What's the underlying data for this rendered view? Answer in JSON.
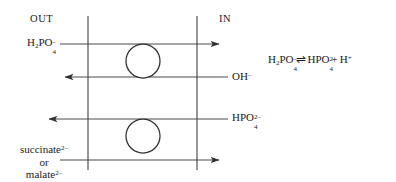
{
  "diagram": {
    "compartments": {
      "outside_label": "OUT",
      "inside_label": "IN"
    },
    "colors": {
      "line": "#3a3a3a",
      "text": "#1a1a1a",
      "background": "#ffffff"
    },
    "membranes": [
      {
        "name": "outer-membrane-line",
        "x": 88,
        "y1": 16,
        "y2": 170
      },
      {
        "name": "inner-membrane-line",
        "x": 197,
        "y1": 16,
        "y2": 170
      }
    ],
    "transporters": [
      {
        "name": "phosphate-transporter",
        "cx": 143,
        "cy": 61,
        "r": 17
      },
      {
        "name": "dicarboxylate-transporter",
        "cx": 143,
        "cy": 136,
        "r": 17
      }
    ],
    "transport_arrows": [
      {
        "name": "h2po4-influx-arrow",
        "y": 44,
        "x1": 60,
        "x2": 222,
        "direction": "right"
      },
      {
        "name": "oh-efflux-arrow",
        "y": 77,
        "x1": 62,
        "x2": 228,
        "direction": "left"
      },
      {
        "name": "hpo4-efflux-arrow",
        "y": 119,
        "x1": 46,
        "x2": 228,
        "direction": "left"
      },
      {
        "name": "dicarboxylate-influx-arrow",
        "y": 160,
        "x1": 60,
        "x2": 222,
        "direction": "right"
      }
    ],
    "labels": {
      "h2po4_out": {
        "formula": "H",
        "sub1": "2",
        "mid": "PO",
        "sub2": "4",
        "charge": "–"
      },
      "oh_in": {
        "formula": "OH",
        "charge": "–"
      },
      "hpo4_in": {
        "formula": "HPO",
        "sub": "4",
        "charge": "2–"
      },
      "succinate": {
        "name": "succinate",
        "charge": "2–"
      },
      "or_text": "or",
      "malate": {
        "name": "malate",
        "charge": "2–"
      }
    },
    "equation": {
      "name": "phosphate-dissociation-equilibrium",
      "reactant": {
        "formula": "H",
        "sub1": "2",
        "mid": "PO",
        "sub2": "4",
        "charge": "–"
      },
      "equilibrium_symbol": "⇌",
      "product1": {
        "formula": "HPO",
        "sub": "4",
        "charge": "2–"
      },
      "plus": "+",
      "product2": {
        "formula": "H",
        "charge": "+"
      },
      "plain_text": "H2PO4- ⇌ HPO4 2- + H+"
    }
  }
}
